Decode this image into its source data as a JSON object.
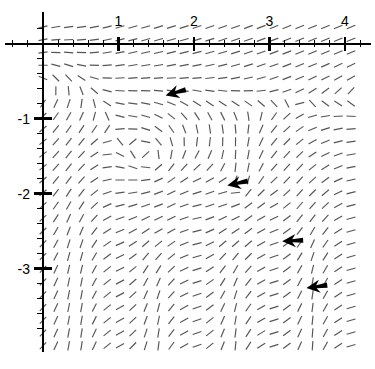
{
  "figure": {
    "type": "direction-field",
    "background": "#ffffff",
    "stroke_color": "#555555",
    "axis_color": "#000000",
    "arrow_color": "#000000"
  },
  "chart_data": {
    "type": "scatter",
    "title": "",
    "subtitle": "",
    "xlabel": "",
    "ylabel": "",
    "grid": false,
    "legend": null,
    "plot_kind": "direction field (slope field) with solution-trajectory arrows",
    "xlim": [
      -0.45,
      4.35
    ],
    "ylim": [
      -4.15,
      0.28
    ],
    "x_major_ticks": [
      1,
      2,
      3,
      4
    ],
    "x_major_tick_labels": [
      "1",
      "2",
      "3",
      "4"
    ],
    "y_major_ticks": [
      -1,
      -2,
      -3
    ],
    "y_major_tick_labels": [
      "-1",
      "-2",
      "-3"
    ],
    "minor_ticks_per_major": 5,
    "x_axis_position_y": 0,
    "y_axis_position_x": 0,
    "field_domain_x": [
      0.0,
      4.22
    ],
    "field_domain_y": [
      -4.12,
      0.22
    ],
    "field_grid_step": 0.17,
    "annotations": [
      {
        "name": "arrow-1",
        "x": 1.77,
        "y": -0.65,
        "angle_deg": 196,
        "label": ""
      },
      {
        "name": "arrow-2",
        "x": 2.59,
        "y": -1.86,
        "angle_deg": 192,
        "label": ""
      },
      {
        "name": "arrow-3",
        "x": 3.32,
        "y": -2.63,
        "angle_deg": 183,
        "label": ""
      },
      {
        "name": "arrow-4",
        "x": 3.64,
        "y": -3.24,
        "angle_deg": 188,
        "label": ""
      }
    ]
  },
  "axes": {
    "x_labels": [
      {
        "value": 1,
        "text": "1"
      },
      {
        "value": 2,
        "text": "2"
      },
      {
        "value": 3,
        "text": "3"
      },
      {
        "value": 4,
        "text": "4"
      }
    ],
    "y_labels": [
      {
        "value": -1,
        "text": "-1"
      },
      {
        "value": -2,
        "text": "-2"
      },
      {
        "value": -3,
        "text": "-3"
      }
    ]
  }
}
